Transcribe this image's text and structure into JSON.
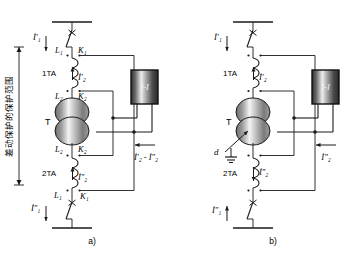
{
  "figure": {
    "caption_a": "a)",
    "caption_b": "b)",
    "vertical_label": "差动保护的保护范围"
  },
  "diagram_a": {
    "name": "normal-operation-differential-protection",
    "transformer_label": "T",
    "ct_top_label": "1TA",
    "ct_bottom_label": "2TA",
    "relay_label": "I-I",
    "terminal_top_L": "L₁",
    "terminal_top_K": "K₁",
    "terminal_upper_L": "L₂",
    "terminal_upper_K": "K₂",
    "terminal_lower_L": "L₂",
    "terminal_lower_K": "K₂",
    "terminal_bottom_L": "L₁",
    "terminal_bottom_K": "K₁",
    "current_primary_top": "İ′₁",
    "current_primary_bottom": "İ″₁",
    "current_secondary_top": "İ′₂",
    "current_secondary_bottom": "İ″₂",
    "current_differential": "İ′₂ - İ″₂"
  },
  "diagram_b": {
    "name": "internal-fault-differential-protection",
    "transformer_label": "T",
    "ct_top_label": "1TA",
    "ct_bottom_label": "2TA",
    "relay_label": "I-I",
    "fault_label": "d",
    "current_primary_top": "İ′₁",
    "current_primary_bottom": "İ″₁",
    "current_secondary_top": "İ′₂",
    "current_secondary_bottom": "İ″₂",
    "current_relay": "İ″₂"
  },
  "colors": {
    "line": "#1a1a1a",
    "relay_fill_dark": "#3d3d3d",
    "relay_fill_light": "#e8e8e8",
    "transformer_fill_dark": "#555555",
    "transformer_fill_light": "#f2f2f2"
  }
}
